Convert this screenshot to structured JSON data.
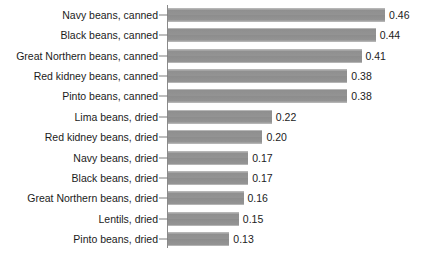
{
  "chart_data": {
    "type": "bar",
    "orientation": "horizontal",
    "title": "",
    "subtitle": "",
    "xlabel": "",
    "ylabel": "",
    "xlim": [
      0,
      0.46
    ],
    "grid": false,
    "legend": false,
    "value_format": "0.00",
    "categories": [
      "Navy beans, canned",
      "Black beans, canned",
      "Great Northern beans, canned",
      "Red kidney beans, canned",
      "Pinto beans, canned",
      "Lima beans, dried",
      "Red kidney beans, dried",
      "Navy beans, dried",
      "Black beans, dried",
      "Great Northern beans, dried",
      "Lentils, dried",
      "Pinto beans, dried"
    ],
    "values": [
      0.46,
      0.44,
      0.41,
      0.38,
      0.38,
      0.22,
      0.2,
      0.17,
      0.17,
      0.16,
      0.15,
      0.13
    ],
    "value_labels": [
      "0.46",
      "0.44",
      "0.41",
      "0.38",
      "0.38",
      "0.22",
      "0.20",
      "0.17",
      "0.17",
      "0.16",
      "0.15",
      "0.13"
    ],
    "bar_color": "#919191",
    "axis_color": "#8a8a8a",
    "text_color": "#1b1b1b",
    "background": "#ffffff"
  }
}
